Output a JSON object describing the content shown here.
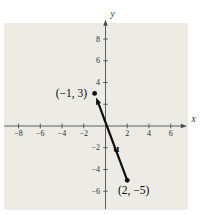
{
  "colors": {
    "background": "#ffffff",
    "panel": "#ecebe6",
    "axis": "#4d4d4d",
    "tick_text": "#2e2e2e",
    "ink": "#0d0d0d"
  },
  "chart_data": {
    "type": "line",
    "title": "",
    "xlabel": "x",
    "ylabel": "y",
    "grid": false,
    "xlim": [
      -9.3,
      7.4
    ],
    "ylim": [
      -7.7,
      9.7
    ],
    "x_ticks": [
      {
        "v": -8,
        "label": "−8"
      },
      {
        "v": -6,
        "label": "−6"
      },
      {
        "v": -4,
        "label": "−4"
      },
      {
        "v": -2,
        "label": "−2"
      },
      {
        "v": 2,
        "label": "2"
      },
      {
        "v": 4,
        "label": "4"
      },
      {
        "v": 6,
        "label": "6"
      }
    ],
    "y_ticks": [
      {
        "v": 8,
        "label": "8"
      },
      {
        "v": 6,
        "label": "6"
      },
      {
        "v": 4,
        "label": "4"
      },
      {
        "v": 2,
        "label": ""
      },
      {
        "v": -2,
        "label": "−2"
      },
      {
        "v": -4,
        "label": "−4"
      },
      {
        "v": -6,
        "label": "−6"
      }
    ],
    "series": [
      {
        "name": "u",
        "kind": "vector",
        "from": [
          2,
          -5
        ],
        "to": [
          -1,
          3
        ]
      }
    ],
    "points": [
      {
        "x": -1,
        "y": 3,
        "label": "(−1, 3)",
        "anchor": "end",
        "dx": -7.5,
        "dy": 3.8
      },
      {
        "x": 2,
        "y": -5,
        "label": "(2, −5)",
        "anchor": "middle",
        "dx": 6.5,
        "dy": 13.5
      }
    ],
    "vector_label": {
      "text": "u",
      "x": 1.0,
      "y": -2.35
    }
  }
}
